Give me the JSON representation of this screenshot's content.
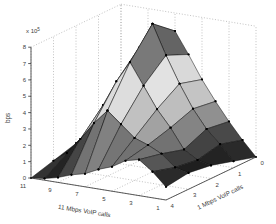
{
  "figure": {
    "background": "#ffffff",
    "plot_style": "MATLAB 3-D surface (surf), grayscale print of jet colormap, black mesh edges with black dot markers at vertices, dotted axis grid"
  },
  "chart_data": {
    "type": "surface",
    "title": "",
    "xlabel": "1 Mbps VoIP calls",
    "ylabel": "11 Mbps VoIP calls",
    "zlabel": "bps",
    "exponent": {
      "base": "x 10",
      "power": "5"
    },
    "x": [
      0,
      1,
      2,
      3,
      4
    ],
    "y": [
      1,
      2,
      3,
      4,
      5,
      6,
      7,
      8,
      9,
      10,
      11
    ],
    "x_tick_labels": [
      "4",
      "3",
      "2",
      "1",
      "0"
    ],
    "y_tick_labels": [
      "11",
      "9",
      "7",
      "5",
      "3",
      "1"
    ],
    "z_tick_labels": [
      "0",
      "1",
      "2",
      "3",
      "4",
      "5",
      "6",
      "7",
      "8"
    ],
    "xlim": [
      0,
      4
    ],
    "ylim": [
      1,
      11
    ],
    "zlim": [
      0,
      8
    ],
    "z_unit_multiplier": 100000,
    "z": [
      [
        0.0,
        0.4,
        0.8,
        1.0,
        0.8
      ],
      [
        0.9,
        1.3,
        1.0,
        1.2,
        1.6
      ],
      [
        1.9,
        2.1,
        1.5,
        1.9,
        2.2
      ],
      [
        3.0,
        3.2,
        2.7,
        2.3,
        2.0
      ],
      [
        4.2,
        4.6,
        3.7,
        2.6,
        1.5
      ],
      [
        5.6,
        6.2,
        5.0,
        3.3,
        1.2
      ],
      [
        6.9,
        8.0,
        6.3,
        4.0,
        0.8
      ],
      [
        5.3,
        6.4,
        5.0,
        3.1,
        0.6
      ],
      [
        3.5,
        4.4,
        3.4,
        2.0,
        0.3
      ],
      [
        1.7,
        2.4,
        1.8,
        1.0,
        0.1
      ],
      [
        0.4,
        0.9,
        0.8,
        0.4,
        0.0
      ]
    ],
    "peak": {
      "x": 1,
      "y": 7,
      "z": 8.0
    },
    "grid": true,
    "legend": null,
    "colormap": "jet (grayscale print)",
    "edge_color": "#111111",
    "marker_color": "#000000",
    "grid_color": "#909090"
  }
}
